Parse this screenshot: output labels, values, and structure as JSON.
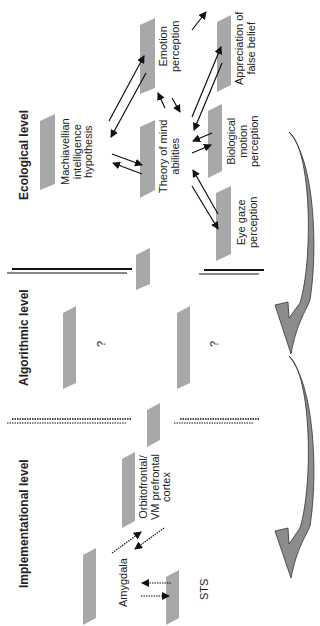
{
  "levels": {
    "ecological": "Ecological level",
    "algorithmic": "Algorithmic level",
    "implementational": "Implementational level"
  },
  "nodes": {
    "machiavellian": [
      "Machiavellian",
      "intelligence",
      "hypothesis"
    ],
    "theory_of_mind": [
      "Theory of mind",
      "abilities"
    ],
    "emotion": [
      "Emotion",
      "perception"
    ],
    "false_belief": [
      "Appreciation of",
      "false belief"
    ],
    "biological_motion": [
      "Biological",
      "motion",
      "perception"
    ],
    "eye_gaze": [
      "Eye gaze",
      "perception"
    ],
    "orbitofrontal": [
      "Orbitofrontal/",
      "VM prefrontal",
      "cortex"
    ],
    "amygdala": [
      "Amygdala"
    ],
    "sts": [
      "STS"
    ]
  },
  "unknowns": {
    "q1": "?",
    "q2": "?"
  },
  "colors": {
    "box": "#a8a8a8",
    "arrow_fill": "#8c8c8c",
    "line": "#111111"
  }
}
